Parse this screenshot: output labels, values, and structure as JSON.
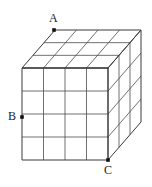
{
  "figure": {
    "type": "3d-grid-box",
    "grid": {
      "front_columns": 4,
      "front_rows": 4,
      "depth_layers": 3
    },
    "geometry": {
      "front_left_x": 22,
      "front_right_x": 108,
      "front_top_y": 68,
      "front_bottom_y": 160,
      "depth_dx": 33,
      "depth_dy": -38
    },
    "style": {
      "stroke_color": "#4d4d4d",
      "outline_color": "#3a3a3a",
      "marker_color": "#111111",
      "background": "#ffffff",
      "stroke_width": 0.8,
      "outline_width": 1.0
    },
    "labels": [
      {
        "id": "A",
        "text": "A",
        "marker_x": 54,
        "marker_y": 30,
        "anchor": "top-back-left-corner"
      },
      {
        "id": "B",
        "text": "B",
        "marker_x": 22,
        "marker_y": 117,
        "anchor": "front-face-left-edge"
      },
      {
        "id": "C",
        "text": "C",
        "marker_x": 108,
        "marker_y": 160,
        "anchor": "front-face-bottom-right-corner"
      }
    ]
  }
}
